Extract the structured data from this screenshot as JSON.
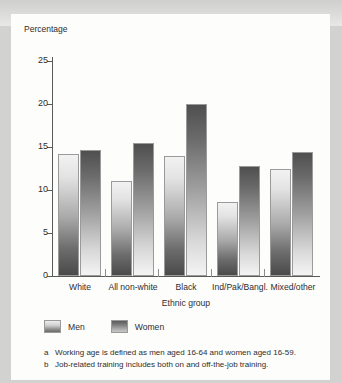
{
  "chart_data": {
    "type": "bar",
    "title": "",
    "ylabel": "Percentage",
    "xlabel": "Ethnic group",
    "ylim": [
      0,
      25
    ],
    "yticks": [
      0,
      5,
      10,
      15,
      20,
      25
    ],
    "grid": false,
    "legend_position": "bottom-left",
    "categories": [
      "White",
      "All non-white",
      "Black",
      "Ind/Pak/Bangl.",
      "Mixed/other"
    ],
    "series": [
      {
        "name": "Men",
        "values": [
          14.2,
          11.0,
          13.9,
          8.6,
          12.5
        ]
      },
      {
        "name": "Women",
        "values": [
          14.6,
          15.5,
          20.0,
          12.8,
          14.4
        ]
      }
    ],
    "footnotes": [
      {
        "marker": "a",
        "text": "Working age is defined as men aged 16-64 and women aged 16-59."
      },
      {
        "marker": "b",
        "text": "Job-related training includes both on and off-the-job training."
      }
    ]
  }
}
